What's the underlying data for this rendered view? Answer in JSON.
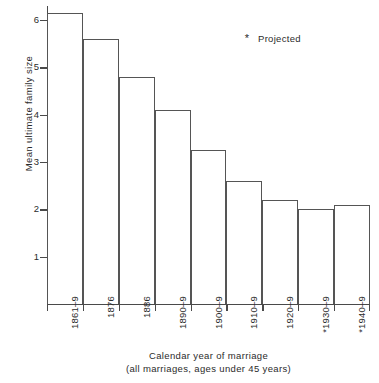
{
  "chart_data": {
    "type": "bar",
    "title": "",
    "xlabel": "Calendar year of marriage",
    "xlabel_sub": "(all marriages, ages under 45 years)",
    "ylabel": "Mean ultimate family size",
    "ylim": [
      0,
      6.3
    ],
    "yticks": [
      1,
      2,
      3,
      4,
      5,
      6
    ],
    "ytick_labels": [
      "1",
      "2",
      "3",
      "4",
      "5",
      "6"
    ],
    "grid": false,
    "categories": [
      "1861–9",
      "1876",
      "1886",
      "1890–9",
      "1900–9",
      "1910–9",
      "1920–9",
      "*1930–9",
      "*1940–9"
    ],
    "values": [
      6.15,
      5.6,
      4.8,
      4.1,
      3.25,
      2.6,
      2.2,
      2.0,
      2.1
    ],
    "projected_flags": [
      false,
      false,
      false,
      false,
      false,
      false,
      false,
      true,
      true
    ],
    "legend": {
      "position": "upper-right",
      "entries": [
        {
          "marker": "*",
          "label": "Projected"
        }
      ]
    },
    "colors": {
      "bar_fill": "#ffffff",
      "bar_edge": "#555555",
      "axis": "#4a4a4a",
      "text": "#2b2b2b",
      "background": "#ffffff"
    }
  }
}
